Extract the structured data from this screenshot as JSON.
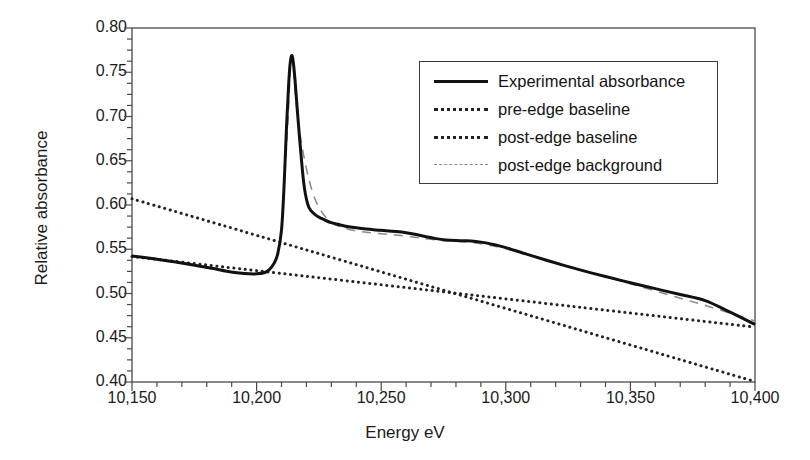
{
  "chart_data": {
    "type": "line",
    "title": "",
    "xlabel": "Energy eV",
    "ylabel": "Relative absorbance",
    "xlim": [
      10150,
      10400
    ],
    "ylim": [
      0.4,
      0.8
    ],
    "xticks": [
      "10,150",
      "10,200",
      "10,250",
      "10,300",
      "10,350",
      "10,400"
    ],
    "xtick_values": [
      10150,
      10200,
      10250,
      10300,
      10350,
      10400
    ],
    "yticks": [
      "0.80",
      "0.75",
      "0.70",
      "0.65",
      "0.60",
      "0.55",
      "0.50",
      "0.45",
      "0.40"
    ],
    "ytick_values": [
      0.8,
      0.75,
      0.7,
      0.65,
      0.6,
      0.55,
      0.5,
      0.45,
      0.4
    ],
    "grid": false,
    "minor_ticks": true,
    "legend_position": "upper-right",
    "series": [
      {
        "name": "Experimental absorbance",
        "style": "solid",
        "color": "#111111",
        "x": [
          10150,
          10158,
          10166,
          10174,
          10182,
          10188,
          10193,
          10197,
          10200,
          10203,
          10205,
          10207,
          10208.5,
          10210,
          10211,
          10212,
          10212.8,
          10213.4,
          10214,
          10214.6,
          10215.4,
          10216.4,
          10217.6,
          10219,
          10220.5,
          10222,
          10224,
          10226,
          10228,
          10230,
          10232,
          10234,
          10237,
          10240,
          10244,
          10248,
          10252,
          10256,
          10260,
          10264,
          10268,
          10272,
          10276,
          10280,
          10284,
          10288,
          10292,
          10296,
          10300,
          10308,
          10316,
          10324,
          10332,
          10340,
          10350,
          10360,
          10370,
          10380,
          10390,
          10400
        ],
        "y": [
          0.5425,
          0.5395,
          0.5362,
          0.5325,
          0.5285,
          0.5252,
          0.5232,
          0.5222,
          0.5222,
          0.5235,
          0.5268,
          0.534,
          0.545,
          0.572,
          0.62,
          0.688,
          0.733,
          0.758,
          0.7685,
          0.764,
          0.742,
          0.705,
          0.664,
          0.623,
          0.601,
          0.593,
          0.588,
          0.5848,
          0.5822,
          0.58,
          0.5785,
          0.5772,
          0.5755,
          0.5742,
          0.5728,
          0.5718,
          0.571,
          0.57,
          0.5686,
          0.5666,
          0.5642,
          0.562,
          0.5605,
          0.5598,
          0.5596,
          0.5588,
          0.5572,
          0.5548,
          0.5518,
          0.5448,
          0.5378,
          0.5312,
          0.525,
          0.5192,
          0.5122,
          0.5055,
          0.4988,
          0.492,
          0.479,
          0.465
        ]
      },
      {
        "name": "pre-edge baseline",
        "style": "dotted",
        "color": "#222222",
        "x": [
          10150,
          10400
        ],
        "y": [
          0.5418,
          0.462
        ]
      },
      {
        "name": "post-edge baseline",
        "style": "dotted",
        "color": "#222222",
        "x": [
          10150,
          10400
        ],
        "y": [
          0.607,
          0.4005
        ]
      },
      {
        "name": "post-edge background",
        "style": "dashed",
        "color": "#8a8a8a",
        "x": [
          10211,
          10212.5,
          10214,
          10216,
          10218,
          10221,
          10224,
          10228,
          10233,
          10238,
          10244,
          10250,
          10256,
          10262,
          10268,
          10274,
          10280,
          10288,
          10296,
          10304,
          10314,
          10324,
          10336,
          10350,
          10366,
          10382,
          10400
        ],
        "y": [
          0.618,
          0.69,
          0.766,
          0.712,
          0.67,
          0.629,
          0.603,
          0.5855,
          0.576,
          0.5718,
          0.5692,
          0.5676,
          0.566,
          0.564,
          0.5618,
          0.56,
          0.5592,
          0.557,
          0.553,
          0.5476,
          0.54,
          0.5318,
          0.5222,
          0.511,
          0.498,
          0.4848,
          0.469
        ]
      }
    ]
  },
  "axes": {
    "x_label": "Energy eV",
    "y_label": "Relative absorbance"
  },
  "legend": {
    "entries": [
      {
        "label": "Experimental absorbance",
        "style": "solid"
      },
      {
        "label": "pre-edge baseline",
        "style": "dotted"
      },
      {
        "label": "post-edge baseline",
        "style": "dotted"
      },
      {
        "label": "post-edge background",
        "style": "dashed"
      }
    ]
  },
  "colors": {
    "axis": "#4a4a4a",
    "experimental": "#111111",
    "baseline": "#222222",
    "background_curve": "#8a8a8a",
    "page_background": "#ffffff"
  }
}
